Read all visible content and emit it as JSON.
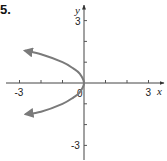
{
  "problem_number": "5.",
  "chart_data": {
    "type": "line",
    "title": "",
    "xlabel": "x",
    "ylabel": "y",
    "xlim": [
      -3.5,
      3.7
    ],
    "ylim": [
      -3.6,
      3.6
    ],
    "grid": false,
    "x_ticks": [
      -3,
      -2,
      -1,
      1,
      2,
      3
    ],
    "y_ticks": [
      -3,
      -2,
      -1,
      1,
      2,
      3
    ],
    "x_tick_labels": [
      {
        "value": -3,
        "label": "-3"
      },
      {
        "value": 3,
        "label": "3"
      }
    ],
    "y_tick_labels": [
      {
        "value": 3,
        "label": "3"
      },
      {
        "value": -3,
        "label": "-3"
      }
    ],
    "origin_label": "0",
    "series": [
      {
        "name": "curve",
        "description": "Parabola opening left with vertex at origin, arrows on both ends",
        "equation_approx": "x = -y^2",
        "color": "#7a7a7a",
        "points": [
          {
            "x": -2.75,
            "y": 1.55
          },
          {
            "x": -2.0,
            "y": 1.38
          },
          {
            "x": -1.0,
            "y": 1.0
          },
          {
            "x": -0.5,
            "y": 0.7
          },
          {
            "x": -0.2,
            "y": 0.45
          },
          {
            "x": 0,
            "y": 0
          },
          {
            "x": -0.2,
            "y": -0.45
          },
          {
            "x": -0.5,
            "y": -0.7
          },
          {
            "x": -1.0,
            "y": -1.0
          },
          {
            "x": -2.0,
            "y": -1.38
          },
          {
            "x": -2.72,
            "y": -1.5
          }
        ],
        "arrows": [
          "start",
          "end"
        ]
      }
    ]
  }
}
